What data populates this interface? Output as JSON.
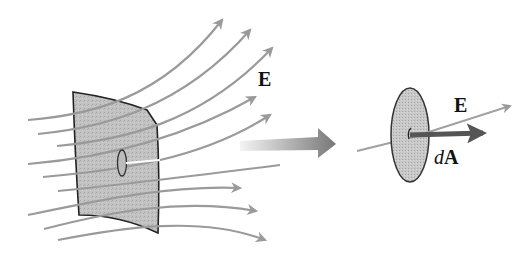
{
  "diagram": {
    "labels": {
      "field_left": "E",
      "field_right": "E",
      "area_vector_d": "d",
      "area_vector_A": "A"
    },
    "colors": {
      "field_line": "#9a9a9a",
      "surface_fill": "#bdbdbd",
      "surface_edge": "#222222",
      "area_vector": "#555555",
      "transition_arrow_start": "#f2f2f2",
      "transition_arrow_end": "#7a7a7a"
    },
    "left_panel": {
      "description": "Curved surface patch with field lines E passing through it; small highlighted area element",
      "field_line_count": 10
    },
    "right_panel": {
      "description": "Magnified area element dA with field vector E at an angle and area vector dA normal to the disk"
    }
  }
}
